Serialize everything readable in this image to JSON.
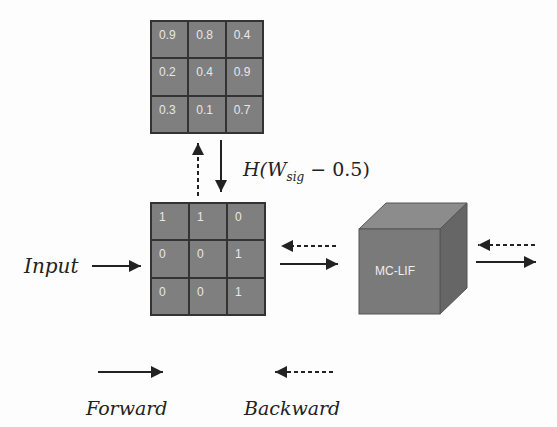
{
  "weights_grid": {
    "cells": [
      [
        "0.9",
        "0.8",
        "0.4"
      ],
      [
        "0.2",
        "0.4",
        "0.9"
      ],
      [
        "0.3",
        "0.1",
        "0.7"
      ]
    ]
  },
  "binary_grid": {
    "cells": [
      [
        "1",
        "1",
        "0"
      ],
      [
        "0",
        "0",
        "1"
      ],
      [
        "0",
        "0",
        "1"
      ]
    ]
  },
  "formula": {
    "prefix": "H(W",
    "subscript": "sig",
    "suffix": " − 0.5)"
  },
  "input_label": "Input",
  "cube_label": "MC-LIF",
  "legend": {
    "forward": "Forward",
    "backward": "Backward"
  },
  "colors": {
    "cell_fill": "#7f7f7f",
    "cube_front": "#7a7a7a",
    "cube_top": "#8c8c8c",
    "cube_side": "#666666",
    "arrow": "#222222"
  }
}
